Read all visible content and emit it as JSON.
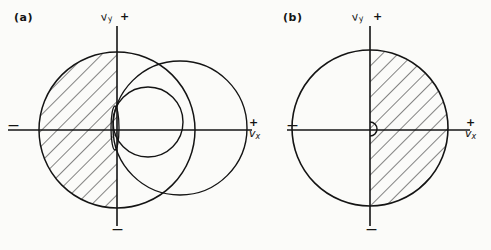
{
  "figure": {
    "background_color": "#fbfbf9",
    "ink_color": "#141414",
    "panels": [
      {
        "id": "a",
        "label": "(a)",
        "axes": {
          "y_label": "v",
          "y_subscript": "y",
          "y_positive_sign": "+",
          "y_negative_sign": "—",
          "x_label": "v",
          "x_subscript": "x",
          "x_positive_sign": "+",
          "x_negative_sign": "—",
          "origin_x": 117,
          "origin_y": 130,
          "x_axis_start": 8,
          "x_axis_end": 252,
          "y_axis_top": 26,
          "y_axis_bottom": 226
        },
        "circles": [
          {
            "name": "left-circle",
            "cx": 117,
            "cy": 130,
            "r": 78,
            "hatched_half": "left"
          },
          {
            "name": "right-large-circle",
            "cx": 180,
            "cy": 128,
            "r": 67,
            "hatched_half": "none"
          },
          {
            "name": "right-small-circle",
            "cx": 148,
            "cy": 122,
            "r": 35,
            "hatched_half": "none"
          }
        ],
        "origin_marker": {
          "name": "origin-lens",
          "shape": "narrow-vertical-lens",
          "rx": 4,
          "ry": 22
        },
        "hatch": {
          "angle_deg": 45,
          "spacing_px": 11
        }
      },
      {
        "id": "b",
        "label": "(b)",
        "axes": {
          "y_label": "v",
          "y_subscript": "y",
          "y_positive_sign": "+",
          "y_negative_sign": "—",
          "x_label": "v",
          "x_subscript": "x",
          "x_positive_sign": "+",
          "x_negative_sign": "—",
          "origin_x": 370,
          "origin_y": 130,
          "x_axis_start": 287,
          "x_axis_end": 470,
          "y_axis_top": 26,
          "y_axis_bottom": 226
        },
        "circles": [
          {
            "name": "main-circle",
            "cx": 370,
            "cy": 128,
            "r": 78,
            "hatched_half": "right"
          }
        ],
        "origin_marker": {
          "name": "origin-bump",
          "shape": "right-opening-semicircle",
          "r": 7
        },
        "hatch": {
          "angle_deg": 45,
          "spacing_px": 11
        }
      }
    ]
  }
}
